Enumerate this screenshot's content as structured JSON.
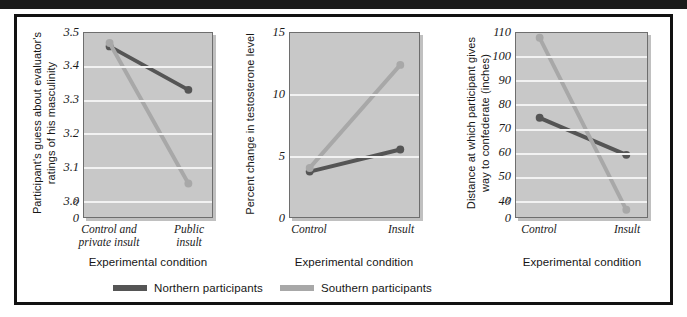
{
  "figure": {
    "background": "#ffffff",
    "frame_color": "#111111",
    "plot_background": "#c8c8c8",
    "gridline_color": "#f2f2f2"
  },
  "series_colors": {
    "northern": "#555555",
    "southern": "#a8a8a8"
  },
  "legend": {
    "items": [
      {
        "label": "Northern participants",
        "color": "#555555",
        "key": "northern"
      },
      {
        "label": "Southern participants",
        "color": "#a8a8a8",
        "key": "southern"
      }
    ]
  },
  "chart_data": [
    {
      "type": "line",
      "id": "masculinity",
      "title": "",
      "xlabel": "Experimental condition",
      "ylabel": "Participant's guess about evaluator's\nratings of his masculinity",
      "categories": [
        "Control and\nprivate insult",
        "Public\ninsult"
      ],
      "yticks": [
        "3.5",
        "3.4",
        "3.3",
        "3.2",
        "3.1",
        "3.0",
        "0"
      ],
      "ytick_values": [
        3.5,
        3.4,
        3.3,
        3.2,
        3.1,
        3.0
      ],
      "ylim": [
        2.95,
        3.5
      ],
      "axis_break": true,
      "grid": true,
      "series": [
        {
          "name": "Northern participants",
          "key": "northern",
          "values": [
            3.46,
            3.33
          ]
        },
        {
          "name": "Southern participants",
          "key": "southern",
          "values": [
            3.47,
            3.05
          ]
        }
      ]
    },
    {
      "type": "line",
      "id": "testosterone",
      "title": "",
      "xlabel": "Experimental condition",
      "ylabel": "Percent change in testosterone level",
      "categories": [
        "Control",
        "Insult"
      ],
      "yticks": [
        "15",
        "10",
        "5",
        "0"
      ],
      "ytick_values": [
        15,
        10,
        5,
        0
      ],
      "ylim": [
        0,
        15
      ],
      "axis_break": false,
      "grid": true,
      "series": [
        {
          "name": "Northern participants",
          "key": "northern",
          "values": [
            3.7,
            5.5
          ]
        },
        {
          "name": "Southern participants",
          "key": "southern",
          "values": [
            4.0,
            12.4
          ]
        }
      ]
    },
    {
      "type": "line",
      "id": "distance",
      "title": "",
      "xlabel": "Experimental condition",
      "ylabel": "Distance at which participant gives\nway to confederate (inches)",
      "categories": [
        "Control",
        "Insult"
      ],
      "yticks": [
        "110",
        "100",
        "90",
        "80",
        "70",
        "60",
        "50",
        "40",
        "0"
      ],
      "ytick_values": [
        110,
        100,
        90,
        80,
        70,
        60,
        50,
        40
      ],
      "ylim": [
        33,
        110
      ],
      "axis_break": true,
      "grid": true,
      "series": [
        {
          "name": "Northern participants",
          "key": "northern",
          "values": [
            74.5,
            59
          ]
        },
        {
          "name": "Southern participants",
          "key": "southern",
          "values": [
            108,
            36
          ]
        }
      ]
    }
  ]
}
